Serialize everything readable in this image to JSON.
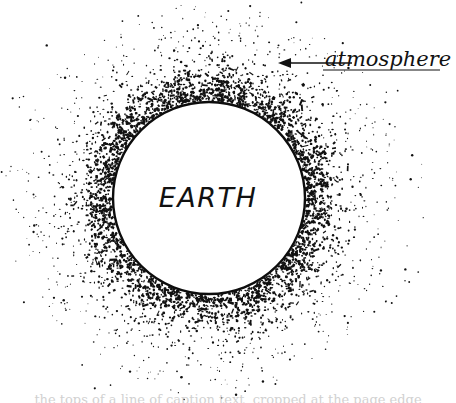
{
  "figure": {
    "background_color": "#ffffff",
    "ink_color": "#111111",
    "width": 456,
    "height": 403,
    "style": "hand-drawn stipple illustration"
  },
  "earth": {
    "label": "EARTH",
    "center_x": 209,
    "center_y": 198,
    "radius": 96,
    "fill_color": "#ffffff",
    "outline_color": "#0d0d0d",
    "outline_width": 2.4,
    "label_font_size": 27,
    "label_x": 208,
    "label_y": 207
  },
  "atmosphere": {
    "label": "atmosphere",
    "label_x": 325,
    "label_y": 66,
    "label_font_size": 21,
    "stipple_color": "#111111",
    "inner_radius": 99,
    "outer_radius": 196,
    "dot_count": 2600,
    "underline": {
      "x1": 323,
      "x2": 440,
      "y": 70
    }
  },
  "leader_arrow": {
    "name": "arrow-pointing-to-atmosphere",
    "tip_x": 278,
    "tip_y": 63,
    "tail_x": 352,
    "tail_y": 63,
    "head_length": 13,
    "head_half_width": 5,
    "line_width": 1.3,
    "color": "#111111"
  },
  "caption": {
    "text": "the tops of a line of caption text, cropped at the page edge",
    "top": 392,
    "height": 11
  },
  "chart_data": {
    "type": "scatter",
    "xlabel": "",
    "ylabel": "",
    "series": [
      {
        "name": "earth-body",
        "shape": "circle",
        "center": [
          209,
          198
        ],
        "radius": 96,
        "label": "EARTH"
      },
      {
        "name": "atmosphere-stipple",
        "shape": "annulus-scatter",
        "center": [
          209,
          198
        ],
        "inner_radius": 99,
        "outer_radius": 196,
        "n_points": 2600,
        "density_profile": "exponential decay with radius",
        "label": "atmosphere"
      }
    ],
    "annotations": [
      {
        "text": "EARTH",
        "x": 208,
        "y": 207
      },
      {
        "text": "atmosphere",
        "x": 325,
        "y": 66
      }
    ],
    "legend": "none",
    "grid": false,
    "xlim": [
      0,
      456
    ],
    "ylim": [
      0,
      403
    ]
  }
}
